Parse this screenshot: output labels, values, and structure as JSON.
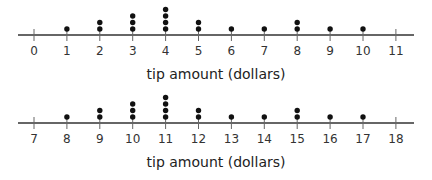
{
  "chart_data": [
    {
      "type": "dot-plot",
      "title": "",
      "xlabel": "tip amount (dollars)",
      "ylabel": "",
      "xlim": [
        0,
        11
      ],
      "ticks": [
        0,
        1,
        2,
        3,
        4,
        5,
        6,
        7,
        8,
        9,
        10,
        11
      ],
      "tick_labels": [
        "0",
        "1",
        "2",
        "3",
        "4",
        "5",
        "6",
        "7",
        "8",
        "9",
        "10",
        "11"
      ],
      "x": [
        0,
        1,
        2,
        3,
        4,
        5,
        6,
        7,
        8,
        9,
        10,
        11
      ],
      "counts": [
        0,
        1,
        2,
        3,
        4,
        2,
        1,
        1,
        2,
        1,
        1,
        0
      ],
      "grid": false
    },
    {
      "type": "dot-plot",
      "title": "",
      "xlabel": "tip amount (dollars)",
      "ylabel": "",
      "xlim": [
        7,
        18
      ],
      "ticks": [
        7,
        8,
        9,
        10,
        11,
        12,
        13,
        14,
        15,
        16,
        17,
        18
      ],
      "tick_labels": [
        "7",
        "8",
        "9",
        "10",
        "11",
        "12",
        "13",
        "14",
        "15",
        "16",
        "17",
        "18"
      ],
      "x": [
        7,
        8,
        9,
        10,
        11,
        12,
        13,
        14,
        15,
        16,
        17,
        18
      ],
      "counts": [
        0,
        1,
        2,
        3,
        4,
        2,
        1,
        1,
        2,
        1,
        1,
        0
      ],
      "grid": false
    }
  ],
  "style": {
    "axis_color": "#333333",
    "dot_color": "#111111"
  }
}
